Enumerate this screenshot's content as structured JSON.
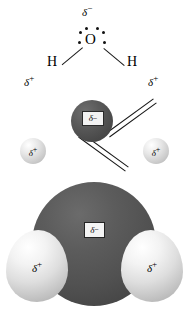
{
  "figure": {
    "background_color": "#ffffff"
  },
  "lewis": {
    "delta_minus": "δ",
    "delta_minus_sign": "−",
    "oxygen_symbol": "O",
    "hydrogen_left": "H",
    "hydrogen_right": "H",
    "delta_plus_left": "δ",
    "delta_plus_left_sign": "+",
    "delta_plus_right": "δ",
    "delta_plus_right_sign": "+",
    "lone_pair_dot_count": 4,
    "bond_dot_count": 2,
    "bond_color": "#1a1a1a",
    "text_color": "#000000"
  },
  "ball_and_stick": {
    "oxygen_label": "δ",
    "oxygen_label_sign": "−",
    "oxygen_color": "#4a4a4a",
    "hydrogen_left_label": "δ",
    "hydrogen_left_sign": "+",
    "hydrogen_right_label": "δ",
    "hydrogen_right_sign": "+",
    "hydrogen_color": "#d2d2d2",
    "bond_color": "#151515"
  },
  "space_filling": {
    "oxygen_label": "δ",
    "oxygen_label_sign": "−",
    "oxygen_color": "#515151",
    "hydrogen_left_label": "δ",
    "hydrogen_left_sign": "+",
    "hydrogen_right_label": "δ",
    "hydrogen_right_sign": "+",
    "hydrogen_color": "#dedede"
  }
}
